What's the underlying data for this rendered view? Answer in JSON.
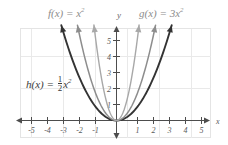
{
  "figure": {
    "kind": "coordinate-plane-graph",
    "background": "#ffffff",
    "frame_color": "#e3e3e3",
    "grid_color": "#e8e8e8",
    "axis_color": "#4d4d4d"
  },
  "annotations": {
    "label_f_prefix": "f(x) = x",
    "label_f_exp": "2",
    "label_g_prefix": "g(x) = 3x",
    "label_g_exp": "2",
    "label_h_prefix": "h(x) = ",
    "label_h_num": "1",
    "label_h_den": "2",
    "label_h_suffix": "x",
    "label_h_exp": "2",
    "axis_label_x": "x",
    "axis_label_y": "y"
  },
  "chart_data": {
    "type": "line",
    "title": "",
    "xlabel": "x",
    "ylabel": "y",
    "xlim": [
      -5.8,
      5.8
    ],
    "ylim": [
      -0.9,
      5.9
    ],
    "grid": true,
    "grid_step": 2,
    "legend": "inline-annotations",
    "xticks": [
      -5,
      -4,
      -3,
      -2,
      -1,
      1,
      2,
      3,
      4,
      5
    ],
    "xtick_labels": [
      "-5",
      "-4",
      "-3",
      "-2",
      "-1",
      "1",
      "2",
      "3",
      "4",
      "5"
    ],
    "yticks": [
      1,
      2,
      3,
      4,
      5
    ],
    "ytick_labels": [
      "1",
      "2",
      "3",
      "4",
      "5"
    ],
    "series": [
      {
        "name": "h(x) = 1/2 x^2",
        "equation": "h(x) = 0.5*x^2",
        "coefficient": 0.5,
        "color": "#333333",
        "width": 1.9,
        "x_domain": [
          -3.45,
          3.45
        ],
        "arrows": [
          "both"
        ],
        "points": [
          {
            "x": -3.45,
            "y": 5.95
          },
          {
            "x": -3.0,
            "y": 4.5
          },
          {
            "x": -2.5,
            "y": 3.13
          },
          {
            "x": -2.0,
            "y": 2.0
          },
          {
            "x": -1.5,
            "y": 1.13
          },
          {
            "x": -1.0,
            "y": 0.5
          },
          {
            "x": -0.5,
            "y": 0.13
          },
          {
            "x": 0.0,
            "y": 0.0
          },
          {
            "x": 0.5,
            "y": 0.13
          },
          {
            "x": 1.0,
            "y": 0.5
          },
          {
            "x": 1.5,
            "y": 1.13
          },
          {
            "x": 2.0,
            "y": 2.0
          },
          {
            "x": 2.5,
            "y": 3.13
          },
          {
            "x": 3.0,
            "y": 4.5
          },
          {
            "x": 3.45,
            "y": 5.95
          }
        ]
      },
      {
        "name": "f(x) = x^2",
        "equation": "f(x) = x^2",
        "coefficient": 1,
        "color": "#8d8d8d",
        "width": 1.5,
        "x_domain": [
          -2.44,
          2.44
        ],
        "arrows": [
          "both"
        ],
        "points": [
          {
            "x": -2.44,
            "y": 5.95
          },
          {
            "x": -2.0,
            "y": 4.0
          },
          {
            "x": -1.5,
            "y": 2.25
          },
          {
            "x": -1.0,
            "y": 1.0
          },
          {
            "x": -0.5,
            "y": 0.25
          },
          {
            "x": 0.0,
            "y": 0.0
          },
          {
            "x": 0.5,
            "y": 0.25
          },
          {
            "x": 1.0,
            "y": 1.0
          },
          {
            "x": 1.5,
            "y": 2.25
          },
          {
            "x": 2.0,
            "y": 4.0
          },
          {
            "x": 2.44,
            "y": 5.95
          }
        ]
      },
      {
        "name": "g(x) = 3x^2",
        "equation": "g(x) = 3*x^2",
        "coefficient": 3,
        "color": "#a8a8a8",
        "width": 1.4,
        "x_domain": [
          -1.41,
          1.41
        ],
        "arrows": [
          "both"
        ],
        "points": [
          {
            "x": -1.41,
            "y": 5.95
          },
          {
            "x": -1.25,
            "y": 4.69
          },
          {
            "x": -1.0,
            "y": 3.0
          },
          {
            "x": -0.75,
            "y": 1.69
          },
          {
            "x": -0.5,
            "y": 0.75
          },
          {
            "x": -0.25,
            "y": 0.19
          },
          {
            "x": 0.0,
            "y": 0.0
          },
          {
            "x": 0.25,
            "y": 0.19
          },
          {
            "x": 0.5,
            "y": 0.75
          },
          {
            "x": 0.75,
            "y": 1.69
          },
          {
            "x": 1.0,
            "y": 3.0
          },
          {
            "x": 1.25,
            "y": 4.69
          },
          {
            "x": 1.41,
            "y": 5.95
          }
        ]
      }
    ],
    "annotations": [
      {
        "text": "f(x) = x^2",
        "x": -2.4,
        "y": 6.9,
        "color": "#8c8c8c"
      },
      {
        "text": "g(x) = 3x^2",
        "x": 1.6,
        "y": 6.9,
        "color": "#8c8c8c"
      },
      {
        "text": "h(x) = 1/2 x^2",
        "x": -4.6,
        "y": 2.3,
        "color": "#3a3a3a"
      }
    ]
  }
}
